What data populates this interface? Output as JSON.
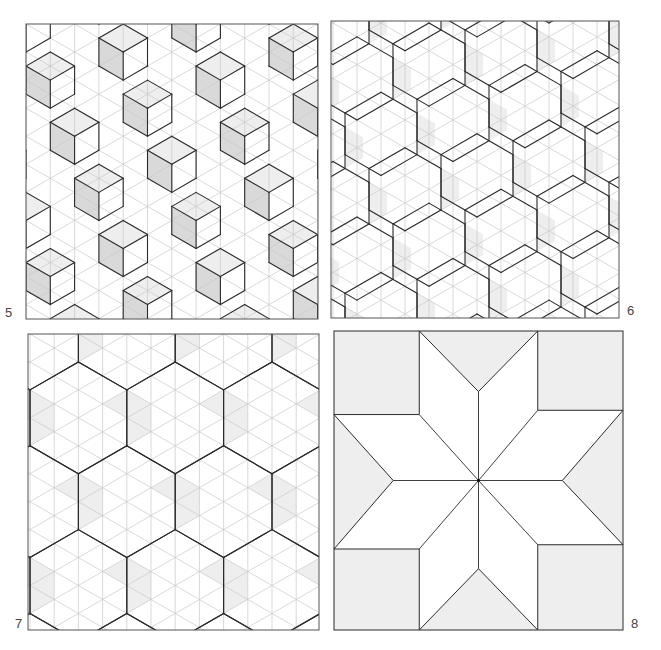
{
  "figure": {
    "panels": [
      {
        "id": "5",
        "label": "5",
        "type": "isometric-tiling",
        "motif": "stacked cubes with shaded vertical rhombi",
        "x": 25,
        "y": 23,
        "w": 292,
        "h": 295,
        "label_pos": {
          "x": 5,
          "y": 306
        }
      },
      {
        "id": "6",
        "label": "6",
        "type": "isometric-tiling",
        "motif": "elongated hexagons along diagonal bands",
        "x": 330,
        "y": 20,
        "w": 288,
        "h": 297,
        "label_pos": {
          "x": 627,
          "y": 304
        }
      },
      {
        "id": "7",
        "label": "7",
        "type": "isometric-tiling",
        "motif": "hexagons and rhombi forming star clusters",
        "x": 27,
        "y": 333,
        "w": 291,
        "h": 296,
        "label_pos": {
          "x": 15,
          "y": 617
        }
      },
      {
        "id": "8",
        "label": "8",
        "type": "quilt-block",
        "motif": "eight-pointed star (LeMoyne star)",
        "x": 333,
        "y": 330,
        "w": 289,
        "h": 299,
        "label_pos": {
          "x": 631,
          "y": 617
        }
      }
    ]
  },
  "colors": {
    "outline": "#2a2a2a",
    "grid": "#c8c8c8",
    "shade_dark": "#d9d9d9",
    "shade_light": "#eeeeee",
    "background": "#ffffff",
    "label": "#444444"
  }
}
